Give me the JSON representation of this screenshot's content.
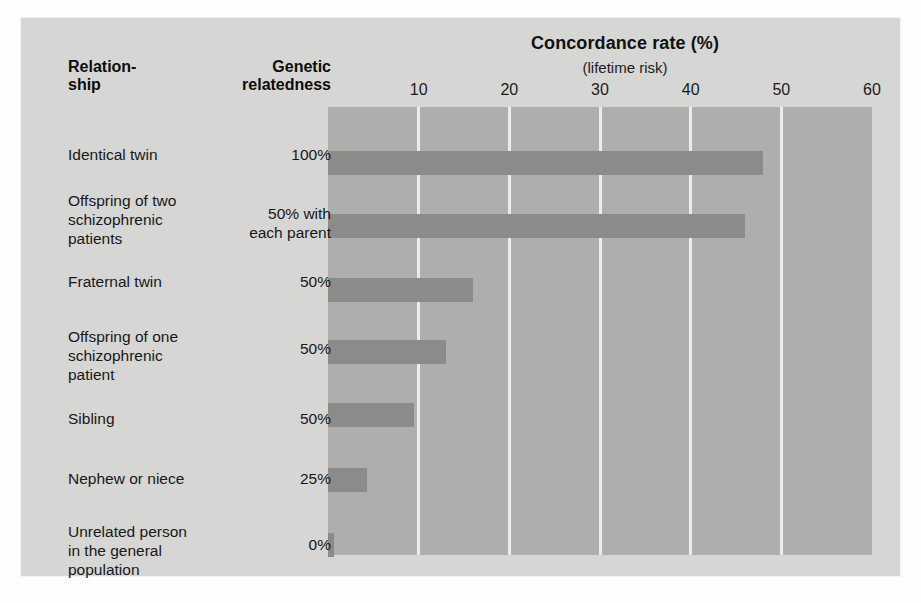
{
  "chart_data": {
    "type": "bar",
    "orientation": "horizontal",
    "title": "Concordance rate (%)",
    "subtitle": "(lifetime risk)",
    "xlabel": "Concordance rate (%)",
    "ylabel": "Relationship",
    "xlim": [
      0,
      60
    ],
    "xticks": [
      10,
      20,
      30,
      40,
      50,
      60
    ],
    "xticklabels": [
      "10",
      "20",
      "30",
      "40",
      "50",
      "60"
    ],
    "grid": true,
    "legend": "none",
    "categories": [
      "Identical twin",
      "Offspring of two schizophrenic patients",
      "Fraternal twin",
      "Offspring of one schizophrenic patient",
      "Sibling",
      "Nephew or niece",
      "Unrelated person in the general population"
    ],
    "values": [
      48,
      46,
      16,
      13,
      9.5,
      4.3,
      0.7
    ],
    "annotations": {
      "genetic_relatedness": [
        "100%",
        "50% with each parent",
        "50%",
        "50%",
        "50%",
        "25%",
        "0%"
      ]
    },
    "colors": {
      "bar": "#8b8b89",
      "plot_background": "#aeaeac",
      "card_background": "#d6d6d4",
      "gridline": "#ececeb"
    }
  },
  "header": {
    "title": "Concordance rate (%)",
    "subtitle": "(lifetime risk)",
    "col_relationship": "Relation-\nship",
    "col_relationship_line1": "Relation-",
    "col_relationship_line2": "ship",
    "col_relatedness_line1": "Genetic",
    "col_relatedness_line2": "relatedness"
  },
  "axis": {
    "ticks": [
      {
        "label": "10",
        "value": 10
      },
      {
        "label": "20",
        "value": 20
      },
      {
        "label": "30",
        "value": 30
      },
      {
        "label": "40",
        "value": 40
      },
      {
        "label": "50",
        "value": 50
      },
      {
        "label": "60",
        "value": 60
      }
    ]
  },
  "rows": [
    {
      "label": "Identical twin",
      "label_lines": [
        "Identical twin"
      ],
      "relatedness": "100%",
      "relatedness_lines": [
        "100%"
      ],
      "value": 48
    },
    {
      "label": "Offspring of two schizophrenic patients",
      "label_lines": [
        "Offspring of two",
        "schizophrenic",
        "patients"
      ],
      "relatedness": "50% with each parent",
      "relatedness_lines": [
        "50% with",
        "each parent"
      ],
      "value": 46
    },
    {
      "label": "Fraternal twin",
      "label_lines": [
        "Fraternal twin"
      ],
      "relatedness": "50%",
      "relatedness_lines": [
        "50%"
      ],
      "value": 16
    },
    {
      "label": "Offspring of one schizophrenic patient",
      "label_lines": [
        "Offspring of one",
        "schizophrenic",
        "patient"
      ],
      "relatedness": "50%",
      "relatedness_lines": [
        "50%"
      ],
      "value": 13
    },
    {
      "label": "Sibling",
      "label_lines": [
        "Sibling"
      ],
      "relatedness": "50%",
      "relatedness_lines": [
        "50%"
      ],
      "value": 9.5
    },
    {
      "label": "Nephew or niece",
      "label_lines": [
        "Nephew or niece"
      ],
      "relatedness": "25%",
      "relatedness_lines": [
        "25%"
      ],
      "value": 4.3
    },
    {
      "label": "Unrelated person in the general population",
      "label_lines": [
        "Unrelated person",
        "in the general",
        "population"
      ],
      "relatedness": "0%",
      "relatedness_lines": [
        "0%"
      ],
      "value": 0.7
    }
  ]
}
